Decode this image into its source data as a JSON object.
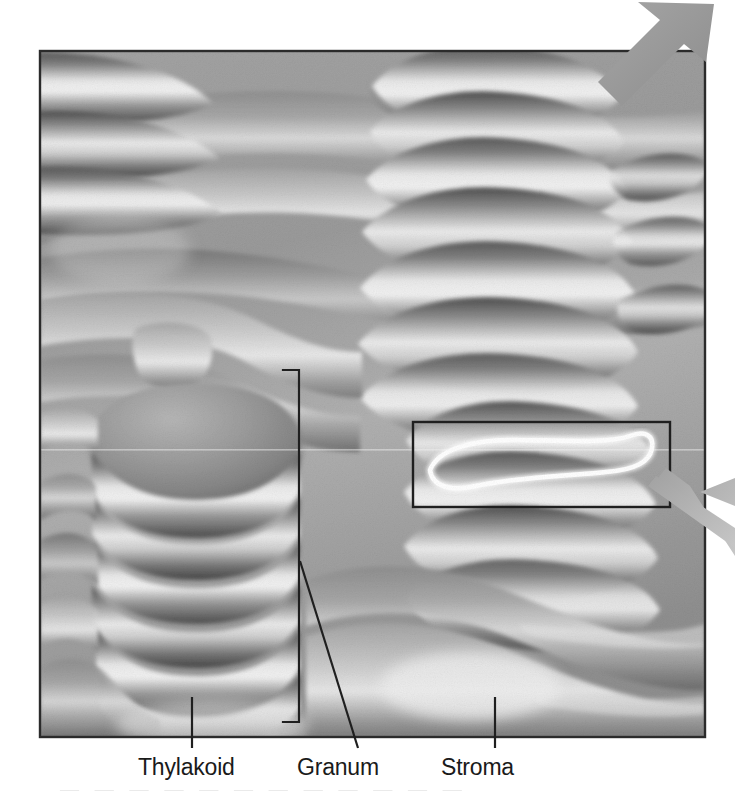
{
  "figure": {
    "kind": "scientific-illustration",
    "rendering": "grayscale shaded three-dimensional cutaway",
    "frame": {
      "x": 39,
      "y": 50,
      "width": 667,
      "height": 688,
      "border_color": "#2b2b2b",
      "border_width": 2
    },
    "background_color": "#ffffff",
    "plate_base_color": "#9a9a9a"
  },
  "labels": [
    {
      "id": "thylakoid",
      "text": "Thylakoid",
      "x": 138,
      "y": 756
    },
    {
      "id": "granum",
      "text": "Granum",
      "x": 297,
      "y": 756
    },
    {
      "id": "stroma",
      "text": "Stroma",
      "x": 441,
      "y": 756
    }
  ],
  "leaders": {
    "thylakoid": {
      "type": "vertical-tick",
      "x": 192,
      "y1": 697,
      "y2": 748,
      "color": "#1f1f1f"
    },
    "granum": {
      "type": "diagonal-line",
      "x1": 300,
      "y1": 561,
      "x2": 358,
      "y2": 748,
      "color": "#1f1f1f"
    },
    "stroma": {
      "type": "vertical-tick",
      "x": 495,
      "y1": 697,
      "y2": 748,
      "color": "#1f1f1f"
    }
  },
  "bracket": {
    "name": "granum-stack-bracket",
    "x": 299,
    "y_top": 370,
    "y_bottom": 722,
    "arm_length": 16,
    "arm_direction": "left",
    "color": "#1f1f1f",
    "stroke_width": 2
  },
  "callout_box": {
    "name": "single-thylakoid-callout",
    "x": 413,
    "y": 422,
    "width": 257,
    "height": 85,
    "border_color": "#1f1f1f",
    "border_width": 2,
    "contains": "single flattened thylakoid disc traced in white outline",
    "outline_color": "#ffffff"
  },
  "arrows": [
    {
      "id": "top-right-arrow",
      "direction": "down-left",
      "color": "#9a9a9a",
      "from": {
        "x": 714,
        "y": 6
      },
      "to": {
        "x": 616,
        "y": 98
      }
    },
    {
      "id": "right-edge-arrow",
      "direction": "up-left",
      "color": "#b4b4b4",
      "from": {
        "x": 735,
        "y": 545
      },
      "to": {
        "x": 658,
        "y": 481
      }
    }
  ],
  "colors": {
    "ink": "#1a1a1a",
    "frame_border": "#2b2b2b",
    "membrane_light": "#ededed",
    "membrane_mid": "#9c9c9c",
    "membrane_dark": "#4f4f4f",
    "stroma_space": "#dcdcdc",
    "arrow_gray": "#9a9a9a",
    "callout_outline": "#ffffff",
    "page_background": "#ffffff"
  },
  "structures": {
    "grana_stacks": 3,
    "left_granum_discs": 6,
    "upper_right_granum_discs": 7,
    "lower_right_granum_discs": 5,
    "stroma_lamellae_bands": 6
  }
}
